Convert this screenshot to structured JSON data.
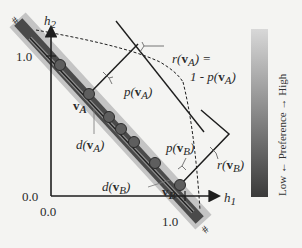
{
  "axes": {
    "x_label": "h",
    "x_sub": "1",
    "y_label": "h",
    "y_sub": "2",
    "x_origin_tick": "0.0",
    "y_origin_tick": "0.0",
    "x_max_tick": "1.0",
    "y_max_tick": "1.0"
  },
  "pareto_band": {
    "end_mark_top": "#",
    "end_mark_bottom": "#"
  },
  "points": {
    "vA": {
      "label": "v",
      "sub": "A"
    },
    "vB": {
      "label": "v",
      "sub": "B"
    }
  },
  "annotations": {
    "pA": {
      "prefix": "p(",
      "v": "v",
      "sub": "A",
      "suffix": ")"
    },
    "pB": {
      "prefix": "p(",
      "v": "v",
      "sub": "B",
      "suffix": ")"
    },
    "dA": {
      "prefix": "d(",
      "v": "v",
      "sub": "A",
      "suffix": ")"
    },
    "dB": {
      "prefix": "d(",
      "v": "v",
      "sub": "B",
      "suffix": ")"
    },
    "rA_line1": {
      "prefix": "r(",
      "v": "v",
      "sub": "A",
      "suffix": ") ="
    },
    "rA_line2": {
      "prefix": "1 - p(",
      "v": "v",
      "sub": "A",
      "suffix": ")"
    },
    "rB": {
      "prefix": "r(",
      "v": "v",
      "sub": "B",
      "suffix": ")"
    }
  },
  "colorbar": {
    "label": "Low ← Preference → High",
    "low_color": "#3a3a3a",
    "high_color": "#d8d8d8"
  },
  "colors": {
    "band_dark": "#4a4a4a",
    "band_light": "#b5b5b5",
    "point_fill": "#5e5e5e",
    "line": "#1e1e1e"
  }
}
